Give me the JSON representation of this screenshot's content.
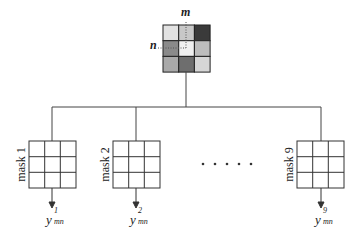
{
  "diagram": {
    "type": "mask-convolution-fanout",
    "input_grid": {
      "row_label": "n",
      "col_label": "m",
      "cells": [
        [
          "#e2e2e2",
          "#c8c8c8",
          "#3a3a3a"
        ],
        [
          "#8a8a8a",
          "#f0f0f0",
          "#bdbdbd"
        ],
        [
          "#a9a9a9",
          "#6e6e6e",
          "#d6d6d6"
        ]
      ],
      "border_color": "#222222"
    },
    "masks": [
      {
        "label": "mask 1",
        "output_base": "y",
        "output_sup": "1",
        "output_sub": "mn"
      },
      {
        "label": "mask 2",
        "output_base": "y",
        "output_sup": "2",
        "output_sub": "mn"
      },
      {
        "label": "mask 9",
        "output_base": "y",
        "output_sup": "9",
        "output_sub": "mn"
      }
    ],
    "ellipsis": "• • • • •",
    "line_color": "#444444"
  }
}
